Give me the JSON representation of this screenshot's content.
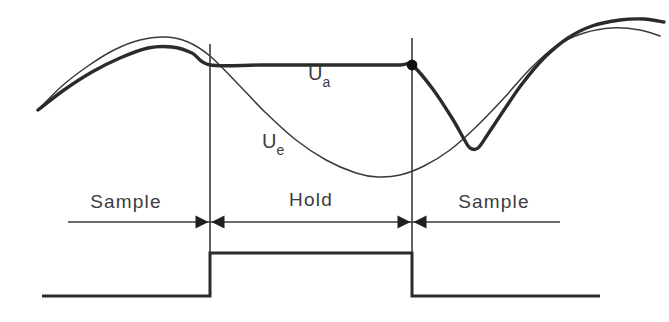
{
  "figure": {
    "background_color": "#ffffff",
    "line_color": "#2b2b2b",
    "thin_line_color": "#3a3a3a"
  },
  "signals": {
    "input": {
      "name": "Ue",
      "base": "U",
      "subscript": "e",
      "label_x": 262,
      "label_y": 148,
      "style": "thin",
      "description": "Input signal, continuous sine-like waveform"
    },
    "output": {
      "name": "Ua",
      "base": "U",
      "subscript": "a",
      "label_x": 308,
      "label_y": 80,
      "style": "thick",
      "description": "Output signal, tracks input during sample and freezes during hold"
    }
  },
  "phases": [
    {
      "label": "Sample",
      "label_x": 126,
      "label_y": 208,
      "start_x": 38,
      "end_x": 210
    },
    {
      "label": "Hold",
      "label_x": 311,
      "label_y": 206,
      "start_x": 210,
      "end_x": 412
    },
    {
      "label": "Sample",
      "label_x": 494,
      "label_y": 208,
      "start_x": 412,
      "end_x": 560
    }
  ],
  "dividers": [
    {
      "name": "hold-start",
      "x": 210,
      "y_top": 44,
      "y_bottom": 296
    },
    {
      "name": "hold-end",
      "x": 412,
      "y_top": 38,
      "y_bottom": 296
    }
  ],
  "sample_marker": {
    "x": 412,
    "y": 65,
    "radius": 5.4
  },
  "timing_axis": {
    "y": 222,
    "x_start": 68,
    "x_end": 560
  },
  "control_pulse": {
    "baseline_y": 296,
    "high_y": 253,
    "x_start": 42,
    "rise_x": 210,
    "fall_x": 412,
    "x_end": 600
  },
  "chart_data": {
    "type": "line",
    "xlabel": "",
    "ylabel": "",
    "grid": false,
    "legend": "inline-annotations",
    "annotations": [
      "Ue",
      "Ua",
      "Sample",
      "Hold",
      "Sample"
    ],
    "series": [
      {
        "name": "Ue",
        "style": "thin",
        "points": [
          [
            38,
            110
          ],
          [
            62,
            86
          ],
          [
            88,
            66
          ],
          [
            114,
            50
          ],
          [
            140,
            40
          ],
          [
            166,
            37
          ],
          [
            188,
            42
          ],
          [
            210,
            56
          ],
          [
            238,
            84
          ],
          [
            266,
            113
          ],
          [
            296,
            140
          ],
          [
            326,
            160
          ],
          [
            356,
            173
          ],
          [
            378,
            177
          ],
          [
            400,
            175
          ],
          [
            424,
            166
          ],
          [
            450,
            150
          ],
          [
            476,
            127
          ],
          [
            504,
            98
          ],
          [
            530,
            69
          ],
          [
            556,
            46
          ],
          [
            584,
            33
          ],
          [
            612,
            28
          ],
          [
            640,
            30
          ],
          [
            660,
            36
          ]
        ]
      },
      {
        "name": "Ua",
        "style": "thick",
        "points": [
          [
            38,
            110
          ],
          [
            64,
            90
          ],
          [
            92,
            72
          ],
          [
            120,
            58
          ],
          [
            148,
            48
          ],
          [
            172,
            47
          ],
          [
            192,
            53
          ],
          [
            210,
            65
          ],
          [
            260,
            65
          ],
          [
            310,
            65
          ],
          [
            360,
            65
          ],
          [
            400,
            65
          ],
          [
            412,
            65
          ],
          [
            432,
            88
          ],
          [
            452,
            118
          ],
          [
            464,
            139
          ],
          [
            470,
            148
          ],
          [
            478,
            148
          ],
          [
            488,
            134
          ],
          [
            504,
            110
          ],
          [
            522,
            84
          ],
          [
            544,
            58
          ],
          [
            568,
            38
          ],
          [
            592,
            26
          ],
          [
            620,
            20
          ],
          [
            644,
            19
          ],
          [
            664,
            22
          ]
        ]
      }
    ]
  }
}
